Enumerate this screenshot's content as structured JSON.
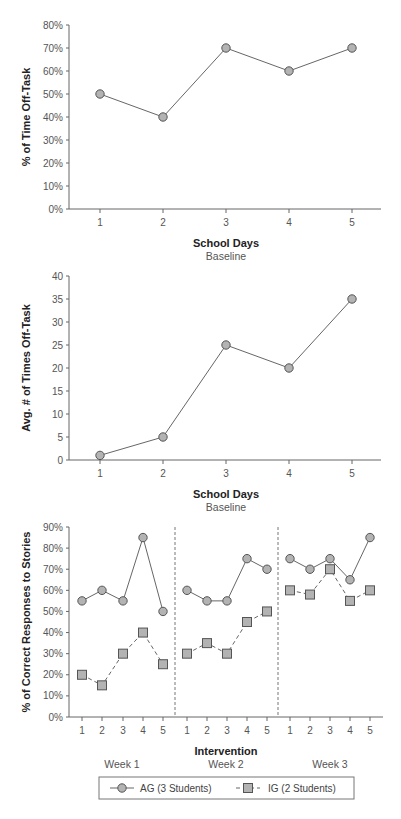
{
  "colors": {
    "axis": "#666666",
    "line": "#666666",
    "marker_fill": "#b3b3b3",
    "marker_stroke": "#555555",
    "divider": "#777777"
  },
  "chart_data": [
    {
      "type": "line",
      "title": "",
      "xlabel": "School Days",
      "subtitle": "Baseline",
      "ylabel": "% of Time Off-Task",
      "categories": [
        "1",
        "2",
        "3",
        "4",
        "5"
      ],
      "values": [
        50,
        40,
        70,
        60,
        70
      ],
      "ylim": [
        0,
        80
      ],
      "yticks": [
        "0%",
        "10%",
        "20%",
        "30%",
        "40%",
        "50%",
        "60%",
        "70%",
        "80%"
      ],
      "grid": false,
      "marker": "circle"
    },
    {
      "type": "line",
      "title": "",
      "xlabel": "School Days",
      "subtitle": "Baseline",
      "ylabel": "Avg. # of Times Off-Task",
      "categories": [
        "1",
        "2",
        "3",
        "4",
        "5"
      ],
      "values": [
        1,
        5,
        25,
        20,
        35
      ],
      "ylim": [
        0,
        40
      ],
      "yticks": [
        "0",
        "5",
        "10",
        "15",
        "20",
        "25",
        "30",
        "35",
        "40"
      ],
      "grid": false,
      "marker": "circle"
    },
    {
      "type": "line",
      "title": "",
      "xlabel": "Intervention",
      "ylabel": "% of Correct Responses to Stories",
      "ylim": [
        0,
        90
      ],
      "yticks": [
        "0%",
        "10%",
        "20%",
        "30%",
        "40%",
        "50%",
        "60%",
        "70%",
        "80%",
        "90%"
      ],
      "phases": [
        "Week 1",
        "Week 2",
        "Week 3"
      ],
      "categories": [
        "1",
        "2",
        "3",
        "4",
        "5",
        "1",
        "2",
        "3",
        "4",
        "5",
        "1",
        "2",
        "3",
        "4",
        "5"
      ],
      "series": [
        {
          "name": "AG (3 Students)",
          "marker": "circle",
          "line": "solid",
          "values": [
            [
              55,
              60,
              55,
              85,
              50
            ],
            [
              60,
              55,
              55,
              75,
              70
            ],
            [
              75,
              70,
              75,
              65,
              85
            ]
          ]
        },
        {
          "name": "IG (2 Students)",
          "marker": "square",
          "line": "dashed",
          "values": [
            [
              20,
              15,
              30,
              40,
              25
            ],
            [
              30,
              35,
              30,
              45,
              50
            ],
            [
              60,
              58,
              70,
              55,
              60
            ]
          ]
        }
      ],
      "legend_position": "bottom",
      "grid": false
    }
  ]
}
